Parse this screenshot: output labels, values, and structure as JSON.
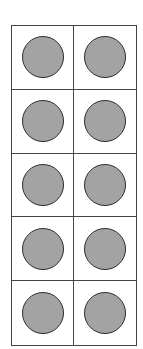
{
  "ten_frame": {
    "rows": 5,
    "columns": 2,
    "filled_count": 10,
    "counter_color": "#a3a3a3",
    "line_color": "#444444",
    "cells": [
      {
        "filled": true
      },
      {
        "filled": true
      },
      {
        "filled": true
      },
      {
        "filled": true
      },
      {
        "filled": true
      },
      {
        "filled": true
      },
      {
        "filled": true
      },
      {
        "filled": true
      },
      {
        "filled": true
      },
      {
        "filled": true
      }
    ]
  }
}
